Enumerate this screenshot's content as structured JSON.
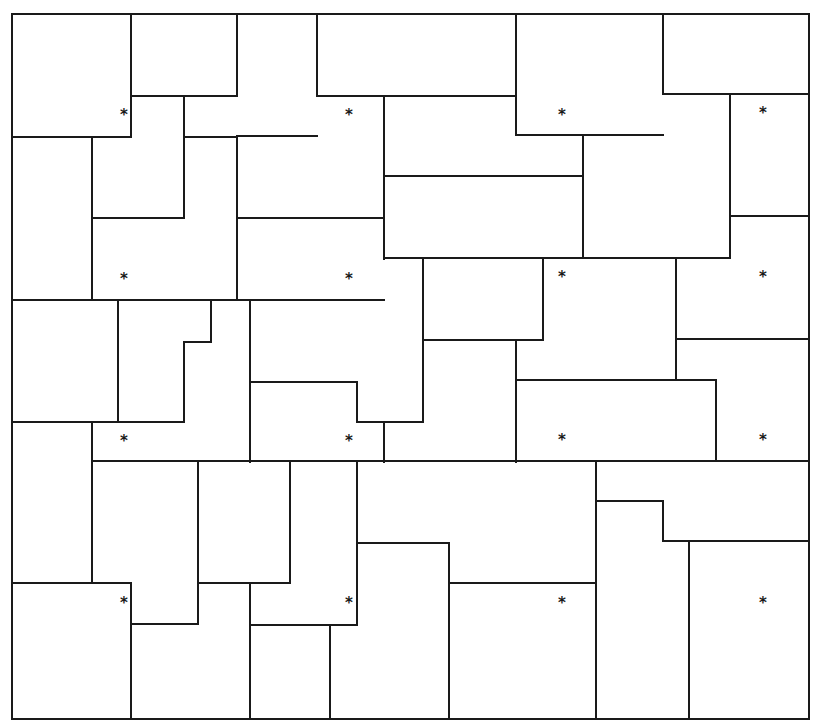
{
  "diagram": {
    "type": "tiling-puzzle",
    "stroke_color": "#1a1a1a",
    "background": "#ffffff",
    "border": {
      "x1": 12,
      "y1": 14,
      "x2": 809,
      "y2": 719
    },
    "segments": [
      [
        131,
        14,
        131,
        137
      ],
      [
        12,
        137,
        131,
        137
      ],
      [
        237,
        14,
        237,
        96
      ],
      [
        131,
        96,
        237,
        96
      ],
      [
        184,
        96,
        184,
        218
      ],
      [
        92,
        218,
        184,
        218
      ],
      [
        184,
        137,
        237,
        137
      ],
      [
        92,
        137,
        92,
        300
      ],
      [
        237,
        137,
        237,
        300
      ],
      [
        317,
        14,
        317,
        96
      ],
      [
        317,
        96,
        384,
        96
      ],
      [
        237,
        136,
        317,
        136
      ],
      [
        384,
        96,
        384,
        259
      ],
      [
        237,
        218,
        384,
        218
      ],
      [
        384,
        176,
        583,
        176
      ],
      [
        516,
        14,
        516,
        135
      ],
      [
        516,
        135,
        663,
        135
      ],
      [
        384,
        96,
        516,
        96
      ],
      [
        583,
        135,
        583,
        258
      ],
      [
        384,
        258,
        730,
        258
      ],
      [
        663,
        14,
        663,
        94
      ],
      [
        663,
        94,
        809,
        94
      ],
      [
        730,
        94,
        730,
        258
      ],
      [
        730,
        216,
        809,
        216
      ],
      [
        12,
        300,
        384,
        300
      ],
      [
        118,
        300,
        118,
        422
      ],
      [
        211,
        300,
        211,
        342
      ],
      [
        184,
        342,
        211,
        342
      ],
      [
        184,
        342,
        184,
        422
      ],
      [
        12,
        422,
        184,
        422
      ],
      [
        92,
        422,
        92,
        583
      ],
      [
        250,
        300,
        250,
        462
      ],
      [
        423,
        258,
        423,
        422
      ],
      [
        423,
        340,
        543,
        340
      ],
      [
        543,
        258,
        543,
        340
      ],
      [
        516,
        340,
        516,
        462
      ],
      [
        250,
        382,
        357,
        382
      ],
      [
        357,
        382,
        357,
        422
      ],
      [
        357,
        422,
        423,
        422
      ],
      [
        384,
        422,
        384,
        462
      ],
      [
        676,
        258,
        676,
        380
      ],
      [
        676,
        339,
        809,
        339
      ],
      [
        516,
        380,
        716,
        380
      ],
      [
        716,
        380,
        716,
        461
      ],
      [
        92,
        461,
        809,
        461
      ],
      [
        198,
        461,
        198,
        624
      ],
      [
        131,
        624,
        198,
        624
      ],
      [
        12,
        583,
        131,
        583
      ],
      [
        131,
        583,
        131,
        719
      ],
      [
        198,
        583,
        290,
        583
      ],
      [
        290,
        461,
        290,
        583
      ],
      [
        250,
        583,
        250,
        719
      ],
      [
        357,
        461,
        357,
        625
      ],
      [
        250,
        625,
        357,
        625
      ],
      [
        330,
        625,
        330,
        719
      ],
      [
        357,
        543,
        449,
        543
      ],
      [
        449,
        543,
        449,
        719
      ],
      [
        449,
        583,
        596,
        583
      ],
      [
        596,
        461,
        596,
        719
      ],
      [
        596,
        501,
        663,
        501
      ],
      [
        663,
        501,
        663,
        541
      ],
      [
        663,
        541,
        809,
        541
      ],
      [
        689,
        541,
        689,
        719
      ]
    ],
    "markers": {
      "glyph": "*",
      "points": [
        [
          124,
          115
        ],
        [
          349,
          115
        ],
        [
          562,
          115
        ],
        [
          763,
          113
        ],
        [
          124,
          279
        ],
        [
          349,
          279
        ],
        [
          562,
          277
        ],
        [
          763,
          277
        ],
        [
          124,
          441
        ],
        [
          349,
          441
        ],
        [
          562,
          440
        ],
        [
          763,
          440
        ],
        [
          124,
          603
        ],
        [
          349,
          603
        ],
        [
          562,
          603
        ],
        [
          763,
          603
        ]
      ]
    }
  }
}
